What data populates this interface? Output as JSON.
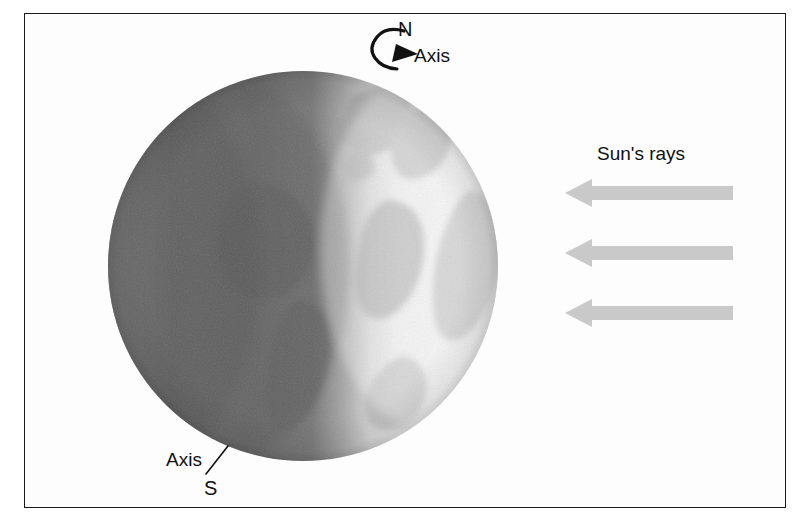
{
  "figure": {
    "type": "diagram",
    "background_color": "#ffffff",
    "frame": {
      "border_color": "#1a1a1a",
      "x": 24,
      "y": 13,
      "width": 762,
      "height": 495
    }
  },
  "globe": {
    "name": "earth-globe",
    "center_x": 303,
    "center_y": 266,
    "radius": 195,
    "night_side": "left",
    "day_side": "right",
    "night_color": "#6f6f6f",
    "day_color": "#f1f1f1",
    "land_color": "#a8a8a8",
    "terminator_x": 345
  },
  "labels": {
    "north_pole": "N",
    "axis_top": "Axis",
    "axis_bottom": "Axis",
    "south_pole": "S",
    "sun_rays": "Sun's rays"
  },
  "rotation_arrow": {
    "name": "rotation-direction-arrow",
    "description": "curved arrow around north pole indicating Earth's rotation",
    "color": "#111111"
  },
  "sun_rays": {
    "color": "#c9c9c9",
    "direction": "left",
    "count": 3,
    "arrows": [
      {
        "label": "sun-ray-arrow-1",
        "y": 193,
        "x_tail": 733,
        "x_tip": 565
      },
      {
        "label": "sun-ray-arrow-2",
        "y": 253,
        "x_tail": 733,
        "x_tip": 565
      },
      {
        "label": "sun-ray-arrow-3",
        "y": 313,
        "x_tail": 733,
        "x_tip": 565
      }
    ]
  }
}
